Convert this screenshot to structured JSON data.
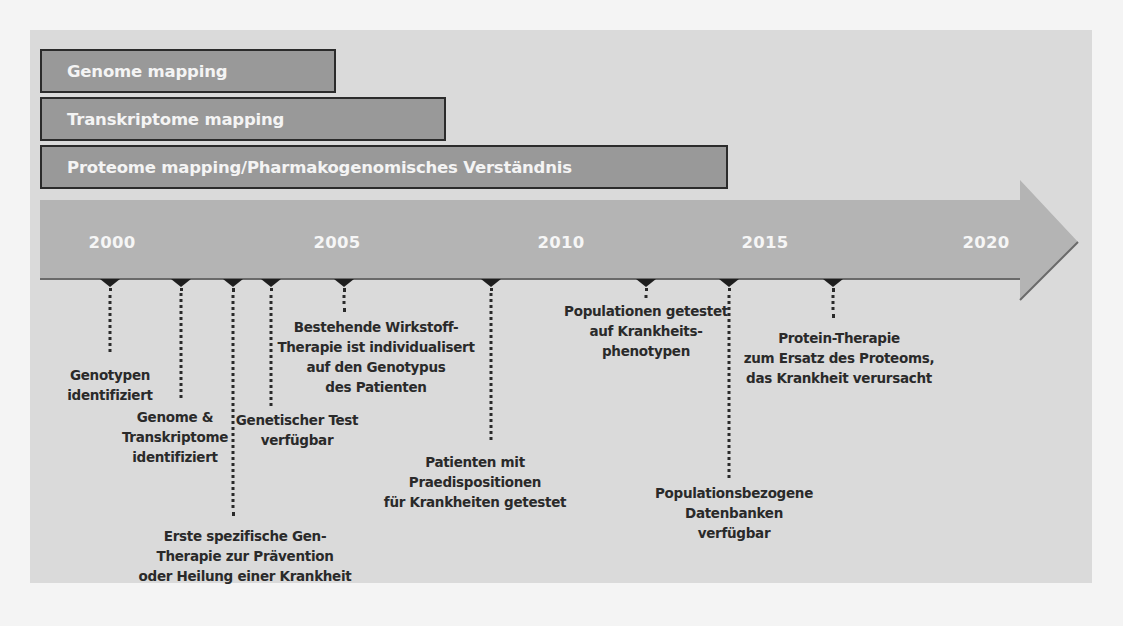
{
  "bars": [
    {
      "label": "Genome mapping",
      "width": 296,
      "top": 49
    },
    {
      "label": "Transkriptome mapping",
      "width": 406,
      "top": 97
    },
    {
      "label": "Proteome mapping/Pharmakogenomisches Verständnis",
      "width": 688,
      "top": 145
    }
  ],
  "axis": {
    "years": [
      {
        "label": "2000",
        "x": 112
      },
      {
        "label": "2005",
        "x": 337
      },
      {
        "label": "2010",
        "x": 561
      },
      {
        "label": "2015",
        "x": 765
      },
      {
        "label": "2020",
        "x": 986
      }
    ],
    "colors": {
      "bar_fill": "#999999",
      "arrow_fill": "#b4b4b4",
      "panel": "#dadada",
      "text": "#2a2a2a"
    }
  },
  "events": [
    {
      "x": 110,
      "stem_top": 288,
      "stem_bottom": 352,
      "label_top": 365,
      "lines": [
        "Genotypen",
        "identifiziert"
      ]
    },
    {
      "x": 181,
      "stem_top": 288,
      "stem_bottom": 398,
      "label_top": 407,
      "lines": [
        "Genome &",
        "Transkriptome",
        "identifiziert"
      ]
    },
    {
      "x": 233,
      "stem_top": 288,
      "stem_bottom": 516,
      "label_top": 526,
      "lines": [
        "Erste spezifische Gen-",
        "Therapie zur Prävention",
        "oder Heilung einer Krankheit"
      ]
    },
    {
      "x": 271,
      "stem_top": 288,
      "stem_bottom": 406,
      "label_top": 410,
      "lines": [
        "Genetischer Test",
        "verfügbar"
      ]
    },
    {
      "x": 344,
      "stem_top": 288,
      "stem_bottom": 312,
      "label_top": 317,
      "lines": [
        "Bestehende Wirkstoff-",
        "Therapie ist individualisert",
        "auf den Genotypus",
        "des Patienten"
      ]
    },
    {
      "x": 491,
      "stem_top": 288,
      "stem_bottom": 440,
      "label_top": 452,
      "lines": [
        "Patienten mit",
        "Praedispositionen",
        "für Krankheiten getestet"
      ]
    },
    {
      "x": 646,
      "stem_top": 288,
      "stem_bottom": 298,
      "label_top": 301,
      "lines": [
        "Populationen getestet",
        "auf Krankheits-",
        "phenotypen"
      ]
    },
    {
      "x": 729,
      "stem_top": 288,
      "stem_bottom": 478,
      "label_top": 483,
      "lines": [
        "Populationsbezogene",
        "Datenbanken",
        "verfügbar"
      ]
    },
    {
      "x": 833,
      "stem_top": 288,
      "stem_bottom": 318,
      "label_top": 328,
      "lines": [
        "Protein-Therapie",
        "zum Ersatz des Proteoms,",
        "das Krankheit verursacht"
      ]
    }
  ]
}
